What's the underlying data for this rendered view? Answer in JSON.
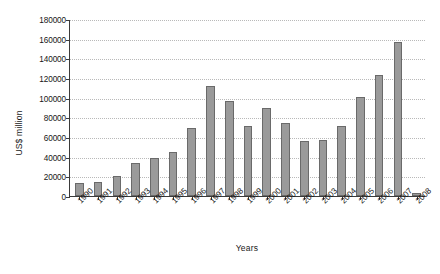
{
  "chart_data": {
    "type": "bar",
    "title": "",
    "xlabel": "Years",
    "ylabel": "US$ million",
    "categories": [
      "1990",
      "1991",
      "1992",
      "1993",
      "1994",
      "1995",
      "1996",
      "1997",
      "1998",
      "1999",
      "2000",
      "2001",
      "2002",
      "2003",
      "2004",
      "2005",
      "2006",
      "2007",
      "2008"
    ],
    "values": [
      13000,
      14000,
      20000,
      34000,
      39000,
      45000,
      69000,
      112000,
      97000,
      71000,
      89000,
      74000,
      56000,
      57000,
      71000,
      101000,
      123000,
      157000,
      3000
    ],
    "ylim": [
      0,
      180000
    ],
    "ytick_values": [
      0,
      20000,
      40000,
      60000,
      80000,
      100000,
      120000,
      140000,
      160000,
      180000
    ],
    "ytick_labels": [
      "0",
      "20000",
      "40000",
      "60000",
      "80000",
      "100000",
      "120000",
      "140000",
      "160000",
      "180000"
    ],
    "grid": true,
    "legend": false,
    "bar_color": "#9a9a9a",
    "bar_edge_color": "#6a6a6a",
    "axis_color": "#3a3a3a",
    "gridline_color": "#b9b9b9"
  }
}
